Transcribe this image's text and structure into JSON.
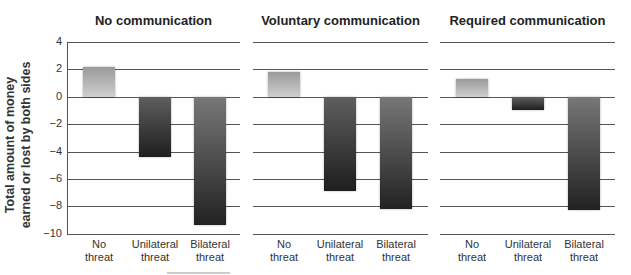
{
  "chart_data": {
    "type": "bar",
    "title": "",
    "ylabel": "Total amount of money earned or lost by both sides",
    "ylabel_lines": [
      "Total amount of money",
      "earned or lost by both sides"
    ],
    "xlabel": "",
    "ylim": [
      -10,
      4
    ],
    "yticks": [
      4,
      2,
      0,
      -2,
      -4,
      -6,
      -8,
      -10
    ],
    "ytick_labels": [
      "4",
      "2",
      "0",
      "−2",
      "−4",
      "−6",
      "−8",
      "−10"
    ],
    "grid": true,
    "categories": [
      "No threat",
      "Unilateral threat",
      "Bilateral threat"
    ],
    "category_labels": [
      "No\nthreat",
      "Unilateral\nthreat",
      "Bilateral\nthreat"
    ],
    "panels": [
      {
        "title": "No communication",
        "values": [
          2.2,
          -4.4,
          -9.4
        ]
      },
      {
        "title": "Voluntary communication",
        "values": [
          1.8,
          -6.9,
          -8.2
        ]
      },
      {
        "title": "Required communication",
        "values": [
          1.3,
          -1.0,
          -8.3
        ]
      }
    ],
    "colors": {
      "no_threat": "#b5b5b5",
      "unilateral": "#333333",
      "bilateral": "#3a3a3a"
    }
  }
}
